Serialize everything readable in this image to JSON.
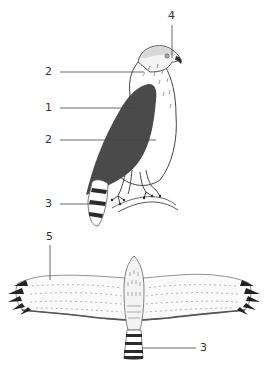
{
  "diagram": {
    "views": [
      "perched side view",
      "dorsal view in flight"
    ],
    "labels": [
      {
        "id": "label-4",
        "text": "4",
        "x": 171,
        "y": 12
      },
      {
        "id": "label-2a",
        "text": "2",
        "x": 44,
        "y": 67
      },
      {
        "id": "label-1",
        "text": "1",
        "x": 44,
        "y": 103
      },
      {
        "id": "label-2b",
        "text": "2",
        "x": 44,
        "y": 135
      },
      {
        "id": "label-3a",
        "text": "3",
        "x": 44,
        "y": 200
      },
      {
        "id": "label-5",
        "text": "5",
        "x": 45,
        "y": 233
      },
      {
        "id": "label-3b",
        "text": "3",
        "x": 202,
        "y": 345
      }
    ],
    "colors": {
      "ink": "#333333",
      "dark_back": "#4a4a4a",
      "tail_band": "#2a2a2a",
      "background": "#ffffff"
    }
  }
}
